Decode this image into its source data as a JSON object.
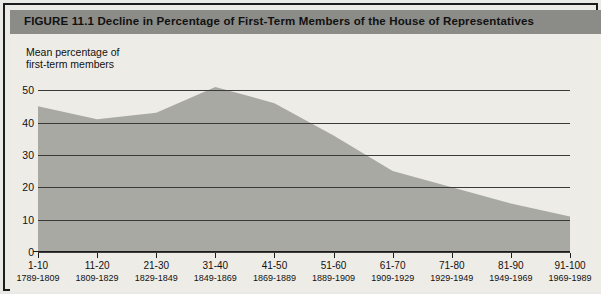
{
  "figure": {
    "title": "FIGURE 11.1  Decline in Percentage of First-Term Members of the House of Representatives",
    "axis_caption": "Mean percentage of\nfirst-term members",
    "colors": {
      "title_bar": "#8b8b87",
      "panel_background": "#eeece7",
      "area_fill": "#a9a9a3",
      "gridline": "#3a3a38",
      "frame": "#1c1c1c"
    }
  },
  "chart_data": {
    "type": "area",
    "title": "FIGURE 11.1  Decline in Percentage of First-Term Members of the House of Representatives",
    "xlabel": "",
    "ylabel": "Mean percentage of first-term members",
    "ylim": [
      0,
      55
    ],
    "yticks": [
      0,
      10,
      20,
      30,
      40,
      50
    ],
    "ytick_labels": [
      "0",
      "10",
      "20",
      "30",
      "40",
      "50"
    ],
    "grid": true,
    "legend": "none",
    "categories": [
      "1-10",
      "11-20",
      "21-30",
      "31-40",
      "41-50",
      "51-60",
      "61-70",
      "71-80",
      "81-90",
      "91-100"
    ],
    "category_sublabels": [
      "1789-1809",
      "1809-1829",
      "1829-1849",
      "1849-1869",
      "1869-1889",
      "1889-1909",
      "1909-1929",
      "1929-1949",
      "1949-1969",
      "1969-1989"
    ],
    "values": [
      45,
      41,
      43,
      51,
      46,
      36,
      25,
      20,
      15,
      11
    ]
  }
}
